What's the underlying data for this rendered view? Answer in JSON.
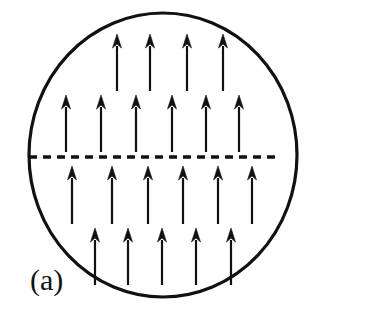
{
  "figure": {
    "panel_label": "(a)",
    "caption_text": "",
    "background_color": "#ffffff",
    "ink_color": "#111111",
    "width": 373,
    "height": 312
  },
  "boundary": {
    "name": "domain-circle",
    "shape": "ellipse",
    "center_x": 163,
    "center_y": 155,
    "radius_x": 134,
    "radius_y": 142,
    "stroke_color": "#111111",
    "stroke_width": 3.2,
    "fill": "none"
  },
  "divider": {
    "name": "domain-wall-dashed-line",
    "orientation": "horizontal",
    "y": 157,
    "x_start": 29,
    "x_end": 279,
    "stroke_color": "#111111",
    "stroke_width": 3.4,
    "dash_length": 8,
    "gap_length": 6
  },
  "arrow_style": {
    "direction": "up",
    "stroke_color": "#111111",
    "shaft_width": 2.2,
    "head_width": 9,
    "head_height": 14
  },
  "chart_data": {
    "type": "diagram",
    "title": "(a)",
    "rows": [
      {
        "row_index": 0,
        "label": "top-row",
        "count": 4,
        "tip_y": 34,
        "tail_y": 91,
        "xs": [
          117,
          150,
          187,
          223
        ]
      },
      {
        "row_index": 1,
        "label": "upper-middle-row",
        "count": 6,
        "tip_y": 95,
        "tail_y": 152,
        "xs": [
          66,
          101,
          136,
          172,
          206,
          239
        ]
      },
      {
        "row_index": 2,
        "label": "lower-middle-row",
        "count": 6,
        "tip_y": 166,
        "tail_y": 224,
        "xs": [
          72,
          112,
          148,
          183,
          218,
          252
        ]
      },
      {
        "row_index": 3,
        "label": "bottom-row",
        "count": 5,
        "tip_y": 228,
        "tail_y": 285,
        "xs": [
          95,
          128,
          162,
          196,
          231
        ]
      }
    ],
    "total_arrows": 21
  },
  "label_position": {
    "x": 30,
    "y": 290
  }
}
